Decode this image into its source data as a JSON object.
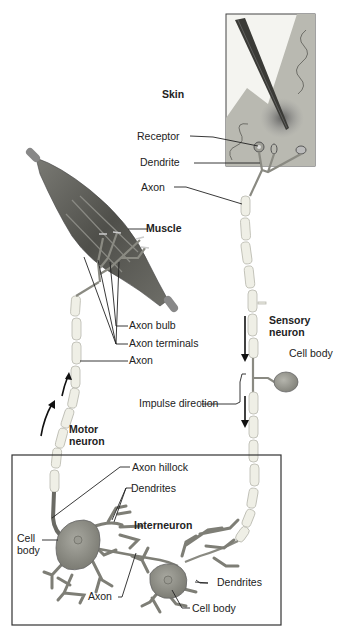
{
  "figure": {
    "labels": {
      "skin": "Skin",
      "receptor": "Receptor",
      "dendrite": "Dendrite",
      "axon_sensory": "Axon",
      "muscle": "Muscle",
      "axon_bulb": "Axon bulb",
      "axon_terminals": "Axon terminals",
      "axon_motor": "Axon",
      "sensory_neuron_line1": "Sensory",
      "sensory_neuron_line2": "neuron",
      "cell_body_sensory": "Cell body",
      "impulse_direction": "Impulse direction",
      "motor_neuron_line1": "Motor",
      "motor_neuron_line2": "neuron",
      "axon_hillock": "Axon hillock",
      "dendrites_upper": "Dendrites",
      "interneuron": "Interneuron",
      "cell_body_left_line1": "Cell",
      "cell_body_left_line2": "body",
      "axon_inter": "Axon",
      "dendrites_lower": "Dendrites",
      "cell_body_lower": "Cell body"
    },
    "colors": {
      "skin_panel": "#b9b9b1",
      "muscle": "#5a5a55",
      "cell_body": "#8e8e86",
      "myelin": "#efefe6",
      "ink": "#222222"
    }
  }
}
